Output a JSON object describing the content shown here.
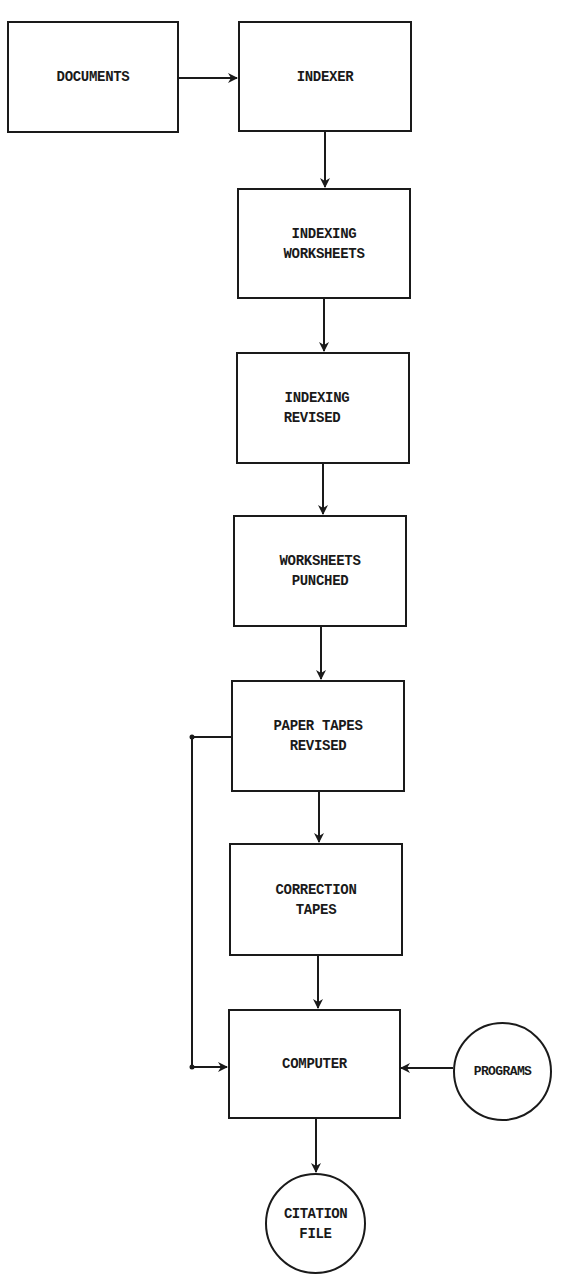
{
  "diagram": {
    "type": "flowchart",
    "colors": {
      "line": "#1a1a1a",
      "background": "#ffffff"
    },
    "nodes": {
      "documents": {
        "shape": "rectangle",
        "lines": [
          "DOCUMENTS"
        ]
      },
      "indexer": {
        "shape": "rectangle",
        "lines": [
          "INDEXER"
        ]
      },
      "indexing_worksheets": {
        "shape": "rectangle",
        "lines": [
          "INDEXING",
          "WORKSHEETS"
        ]
      },
      "indexing_revised": {
        "shape": "rectangle",
        "lines": [
          "INDEXING",
          "REVISED"
        ]
      },
      "worksheets_punched": {
        "shape": "rectangle",
        "lines": [
          "WORKSHEETS",
          "PUNCHED"
        ]
      },
      "paper_tapes_revised": {
        "shape": "rectangle",
        "lines": [
          "PAPER TAPES",
          "REVISED"
        ]
      },
      "correction_tapes": {
        "shape": "rectangle",
        "lines": [
          "CORRECTION",
          "TAPES"
        ]
      },
      "computer": {
        "shape": "rectangle",
        "lines": [
          "COMPUTER"
        ]
      },
      "programs": {
        "shape": "circle",
        "lines": [
          "PROGRAMS"
        ]
      },
      "citation_file": {
        "shape": "circle",
        "lines": [
          "CITATION",
          "FILE"
        ]
      }
    },
    "edges": [
      {
        "from": "DOCUMENTS",
        "to": "INDEXER"
      },
      {
        "from": "INDEXER",
        "to": "INDEXING WORKSHEETS"
      },
      {
        "from": "INDEXING WORKSHEETS",
        "to": "INDEXING REVISED"
      },
      {
        "from": "INDEXING REVISED",
        "to": "WORKSHEETS PUNCHED"
      },
      {
        "from": "WORKSHEETS PUNCHED",
        "to": "PAPER TAPES REVISED"
      },
      {
        "from": "PAPER TAPES REVISED",
        "to": "CORRECTION TAPES"
      },
      {
        "from": "PAPER TAPES REVISED",
        "to": "COMPUTER",
        "route": "left-loop"
      },
      {
        "from": "CORRECTION TAPES",
        "to": "COMPUTER"
      },
      {
        "from": "PROGRAMS",
        "to": "COMPUTER"
      },
      {
        "from": "COMPUTER",
        "to": "CITATION FILE"
      }
    ]
  }
}
